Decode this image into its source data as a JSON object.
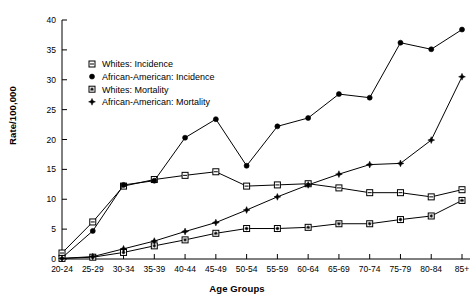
{
  "chart_data": {
    "type": "line",
    "title": "",
    "xlabel": "Age Groups",
    "ylabel": "Rate/100,000",
    "categories": [
      "20-24",
      "25-29",
      "30-34",
      "35-39",
      "40-44",
      "45-49",
      "50-54",
      "55-59",
      "60-64",
      "65-69",
      "70-74",
      "75-79",
      "80-84",
      "85+"
    ],
    "ylim": [
      0,
      40
    ],
    "yticks": [
      0,
      5,
      10,
      15,
      20,
      25,
      30,
      35,
      40
    ],
    "grid": false,
    "legend_position": "upper-left-inside",
    "series": [
      {
        "name": "Whites: Incidence",
        "marker": "open-square-with-line",
        "values": [
          1.0,
          6.2,
          12.2,
          13.3,
          14.0,
          14.6,
          12.2,
          12.4,
          12.6,
          11.9,
          11.1,
          11.1,
          10.4,
          11.6
        ]
      },
      {
        "name": "African-American: Incidence",
        "marker": "filled-circle",
        "values": [
          0.2,
          4.7,
          12.4,
          13.1,
          20.3,
          23.4,
          15.6,
          22.2,
          23.6,
          27.6,
          27.0,
          36.2,
          35.1,
          38.4
        ]
      },
      {
        "name": "Whites: Mortality",
        "marker": "open-square-with-star",
        "values": [
          0.1,
          0.3,
          1.1,
          2.2,
          3.2,
          4.3,
          5.1,
          5.1,
          5.3,
          5.9,
          5.9,
          6.6,
          7.2,
          9.8
        ]
      },
      {
        "name": "African-American: Mortality",
        "marker": "filled-star",
        "values": [
          0.1,
          0.4,
          1.7,
          3.0,
          4.6,
          6.1,
          8.2,
          10.4,
          12.4,
          14.2,
          15.8,
          16.0,
          19.9,
          30.5
        ]
      }
    ]
  },
  "legend": {
    "items": [
      {
        "label": "Whites: Incidence"
      },
      {
        "label": "African-American: Incidence"
      },
      {
        "label": "Whites: Mortality"
      },
      {
        "label": "African-American: Mortality"
      }
    ]
  },
  "colors": {
    "line": "#000000",
    "axis": "#000000",
    "background": "#ffffff"
  }
}
